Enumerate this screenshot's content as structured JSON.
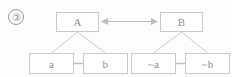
{
  "figure": {
    "marker_label": "③",
    "marker_number": "3",
    "caption": ""
  },
  "colors": {
    "background": "#fdfdfd",
    "box_border": "#c9c9c9",
    "text": "#8d8d8d",
    "edge": "#cccccc",
    "connector": "#bdbdbd",
    "marker_border": "#9a9a9a"
  },
  "diagram": {
    "type": "node-link",
    "nodes": [
      {
        "id": "A",
        "label": "A",
        "group": "left",
        "level": "top"
      },
      {
        "id": "B",
        "label": "B",
        "group": "right",
        "level": "top"
      },
      {
        "id": "a",
        "label": "a",
        "group": "left",
        "level": "bottom"
      },
      {
        "id": "b",
        "label": "b",
        "group": "left",
        "level": "bottom"
      },
      {
        "id": "na",
        "label": "~a",
        "group": "right",
        "level": "bottom"
      },
      {
        "id": "nb",
        "label": "~b",
        "group": "right",
        "level": "bottom"
      }
    ],
    "edges": [
      {
        "from": "A",
        "to": "a",
        "style": "diagonal"
      },
      {
        "from": "A",
        "to": "b",
        "style": "diagonal"
      },
      {
        "from": "a",
        "to": "b",
        "style": "horizontal"
      },
      {
        "from": "B",
        "to": "na",
        "style": "diagonal"
      },
      {
        "from": "B",
        "to": "nb",
        "style": "diagonal"
      },
      {
        "from": "na",
        "to": "nb",
        "style": "horizontal"
      },
      {
        "from": "A",
        "to": "B",
        "style": "double-arrow",
        "glyph": "↔"
      }
    ]
  }
}
